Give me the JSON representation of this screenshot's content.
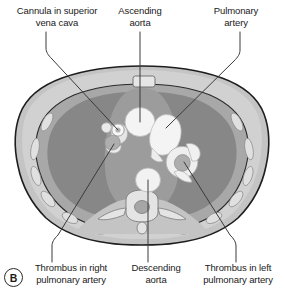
{
  "figure": {
    "panel_letter": "B"
  },
  "labels": [
    {
      "id": "cannula",
      "text": "Cannula in superior\nvena cava",
      "position": "top-left"
    },
    {
      "id": "ascending",
      "text": "Ascending\naorta",
      "position": "top-center"
    },
    {
      "id": "pulmonary",
      "text": "Pulmonary\nartery",
      "position": "top-right"
    },
    {
      "id": "thrombus_rt",
      "text": "Thrombus in right\npulmonary artery",
      "position": "bottom-left"
    },
    {
      "id": "descending",
      "text": "Descending\naorta",
      "position": "bottom-center"
    },
    {
      "id": "thrombus_lt",
      "text": "Thrombus in left\npulmonary artery",
      "position": "bottom-right"
    }
  ],
  "colors": {
    "background": "#ffffff",
    "outline": "#1e1e1e",
    "body_wall": "#c9c9c9",
    "subcutaneous_fat": "#d8d8d8",
    "muscle": "#b4b4b4",
    "lung_field": "#8a8a8a",
    "mediastinum": "#9d9d9d",
    "vessel_contrast": "#f2f2f2",
    "bone": "#e4e4e4",
    "thrombus": "#b0b0b0",
    "leader_line": "#3a3a3a",
    "text": "#1a1a1a"
  },
  "structures": [
    {
      "name": "sternum",
      "kind": "bone"
    },
    {
      "name": "ribs",
      "kind": "bone"
    },
    {
      "name": "vertebral-body",
      "kind": "bone"
    },
    {
      "name": "spinal-canal",
      "kind": "bone"
    },
    {
      "name": "right-lung",
      "kind": "lung"
    },
    {
      "name": "left-lung",
      "kind": "lung"
    },
    {
      "name": "ascending-aorta",
      "kind": "vessel"
    },
    {
      "name": "descending-aorta",
      "kind": "vessel"
    },
    {
      "name": "pulmonary-artery",
      "kind": "vessel"
    },
    {
      "name": "superior-vena-cava",
      "kind": "vessel"
    },
    {
      "name": "cannula",
      "kind": "device"
    },
    {
      "name": "right-pulmonary-artery-thrombus",
      "kind": "thrombus"
    },
    {
      "name": "left-pulmonary-artery-thrombus",
      "kind": "thrombus"
    }
  ]
}
